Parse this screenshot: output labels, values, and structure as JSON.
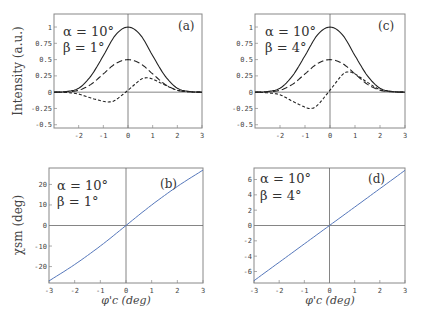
{
  "chart_data": [
    {
      "id": "a",
      "type": "line",
      "panel_label": "(a)",
      "annotation": {
        "alpha": "α = 10°",
        "beta": "β = 1°"
      },
      "ylabel": "Intensity (a.u.)",
      "xlabel": "",
      "xlim": [
        -3,
        3
      ],
      "ylim": [
        -0.55,
        1.2
      ],
      "xticks": [
        -2,
        -1,
        0,
        1,
        2,
        3
      ],
      "yticks": [
        1,
        0.75,
        0.5,
        0.25,
        0,
        -0.25,
        -0.5
      ],
      "ytick_labels": [
        "1",
        "0.75",
        "0.5",
        "0.25",
        "0",
        "-0.25",
        "-0.5"
      ],
      "series": [
        {
          "name": "solid",
          "style": "solid",
          "x": [
            -3,
            -2.5,
            -2,
            -1.5,
            -1,
            -0.5,
            0,
            0.5,
            1,
            1.5,
            2,
            2.5,
            3
          ],
          "values": [
            0,
            0.01,
            0.06,
            0.25,
            0.56,
            0.88,
            1.0,
            0.88,
            0.56,
            0.25,
            0.06,
            0.01,
            0
          ]
        },
        {
          "name": "long-dash",
          "style": "dashed",
          "x": [
            -3,
            -2.5,
            -2,
            -1.5,
            -1,
            -0.5,
            0,
            0.5,
            1,
            1.5,
            2,
            2.5,
            3
          ],
          "values": [
            0,
            0.005,
            0.03,
            0.12,
            0.28,
            0.44,
            0.5,
            0.44,
            0.28,
            0.12,
            0.03,
            0.005,
            0
          ]
        },
        {
          "name": "short-dash",
          "style": "dotted",
          "x": [
            -3,
            -2.5,
            -2,
            -1.5,
            -1,
            -0.75,
            -0.5,
            0,
            0.5,
            0.75,
            1,
            1.5,
            2,
            2.5,
            3
          ],
          "values": [
            0,
            -0.005,
            -0.03,
            -0.09,
            -0.14,
            -0.15,
            -0.12,
            0.03,
            0.19,
            0.22,
            0.2,
            0.11,
            0.03,
            0.005,
            0
          ]
        }
      ]
    },
    {
      "id": "c",
      "type": "line",
      "panel_label": "(c)",
      "annotation": {
        "alpha": "α = 10°",
        "beta": "β = 4°"
      },
      "ylabel": "",
      "xlabel": "",
      "xlim": [
        -3,
        3
      ],
      "ylim": [
        -0.55,
        1.2
      ],
      "xticks": [
        -2,
        -1,
        0,
        1,
        2,
        3
      ],
      "yticks": [
        1,
        0.75,
        0.5,
        0.25,
        0,
        -0.25,
        -0.5
      ],
      "ytick_labels": [
        "1",
        "0.75",
        "0.5",
        "0.25",
        "0",
        "-0.25",
        "-0.5"
      ],
      "series": [
        {
          "name": "solid",
          "style": "solid",
          "x": [
            -3,
            -2.5,
            -2,
            -1.5,
            -1,
            -0.5,
            0,
            0.5,
            1,
            1.5,
            2,
            2.5,
            3
          ],
          "values": [
            0,
            0.01,
            0.06,
            0.25,
            0.56,
            0.88,
            1.0,
            0.88,
            0.56,
            0.25,
            0.06,
            0.01,
            0
          ]
        },
        {
          "name": "long-dash",
          "style": "dashed",
          "x": [
            -3,
            -2.5,
            -2,
            -1.5,
            -1,
            -0.5,
            0,
            0.5,
            1,
            1.5,
            2,
            2.5,
            3
          ],
          "values": [
            0,
            0.005,
            0.03,
            0.12,
            0.28,
            0.44,
            0.5,
            0.44,
            0.28,
            0.12,
            0.03,
            0.005,
            0
          ]
        },
        {
          "name": "short-dash",
          "style": "dotted",
          "x": [
            -3,
            -2.5,
            -2,
            -1.5,
            -1,
            -0.75,
            -0.5,
            0,
            0.5,
            0.75,
            1,
            1.5,
            2,
            2.5,
            3
          ],
          "values": [
            0,
            -0.01,
            -0.04,
            -0.14,
            -0.23,
            -0.25,
            -0.2,
            0.03,
            0.27,
            0.31,
            0.28,
            0.15,
            0.04,
            0.008,
            0
          ]
        }
      ]
    },
    {
      "id": "b",
      "type": "line",
      "panel_label": "(b)",
      "annotation": {
        "alpha": "α = 10°",
        "beta": "β = 1°"
      },
      "ylabel": "χsm (deg)",
      "xlabel": "φ'c (deg)",
      "xlim": [
        -3,
        3
      ],
      "ylim": [
        -28,
        28
      ],
      "xticks": [
        -3,
        -2,
        -1,
        0,
        1,
        2,
        3
      ],
      "yticks": [
        20,
        10,
        0,
        -10,
        -20
      ],
      "ytick_labels": [
        "20",
        "10",
        "0",
        "-10",
        "-20"
      ],
      "series": [
        {
          "name": "chi_sm",
          "style": "solid",
          "color": "#5577bb",
          "x": [
            -3,
            -2,
            -1,
            0,
            1,
            2,
            3
          ],
          "values": [
            -27,
            -19,
            -10,
            0,
            10,
            19,
            27
          ]
        }
      ]
    },
    {
      "id": "d",
      "type": "line",
      "panel_label": "(d)",
      "annotation": {
        "alpha": "α = 10°",
        "beta": "β = 4°"
      },
      "ylabel": "",
      "xlabel": "φ'c (deg)",
      "xlim": [
        -3,
        3
      ],
      "ylim": [
        -7.5,
        7.5
      ],
      "xticks": [
        -3,
        -2,
        -1,
        0,
        1,
        2,
        3
      ],
      "yticks": [
        6,
        4,
        2,
        0,
        -2,
        -4,
        -6
      ],
      "ytick_labels": [
        "6",
        "4",
        "2",
        "0",
        "-2",
        "-4",
        "-6"
      ],
      "series": [
        {
          "name": "chi_sm",
          "style": "solid",
          "color": "#5577bb",
          "x": [
            -3,
            -2,
            -1,
            0,
            1,
            2,
            3
          ],
          "values": [
            -7.2,
            -4.8,
            -2.4,
            0,
            2.4,
            4.8,
            7.2
          ]
        }
      ]
    }
  ],
  "panels": {
    "a": {
      "label": "(a)",
      "alpha": "α = 10°",
      "beta": "β = 1°",
      "ylabel": "Intensity (a.u.)"
    },
    "c": {
      "label": "(c)",
      "alpha": "α = 10°",
      "beta": "β = 4°"
    },
    "b": {
      "label": "(b)",
      "alpha": "α = 10°",
      "beta": "β = 1°",
      "ylabel": "χsm (deg)",
      "xlabel": "φ'c (deg)"
    },
    "d": {
      "label": "(d)",
      "alpha": "α = 10°",
      "beta": "β = 4°",
      "xlabel": "φ'c (deg)"
    }
  },
  "colors": {
    "frame": "#888888",
    "curve_black": "#222222",
    "curve_blue": "#5577bb",
    "tick_text": "#444444"
  }
}
